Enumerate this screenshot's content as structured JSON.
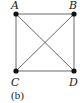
{
  "graph": {
    "caption": "(b)",
    "nodes": [
      {
        "id": "A",
        "label": "A",
        "x": 16,
        "y": 14,
        "lx": 11,
        "ly": 9
      },
      {
        "id": "B",
        "label": "B",
        "x": 74,
        "y": 14,
        "lx": 68,
        "ly": 9
      },
      {
        "id": "C",
        "label": "C",
        "x": 16,
        "y": 71,
        "lx": 11,
        "ly": 87
      },
      {
        "id": "D",
        "label": "D",
        "x": 74,
        "y": 71,
        "lx": 68,
        "ly": 87
      }
    ],
    "edges": [
      [
        "A",
        "B"
      ],
      [
        "A",
        "C"
      ],
      [
        "A",
        "D"
      ],
      [
        "B",
        "C"
      ],
      [
        "B",
        "D"
      ],
      [
        "C",
        "D"
      ]
    ],
    "colors": {
      "edge": "#6a6a6a",
      "node": "#111111",
      "text": "#1a1a1a"
    }
  }
}
